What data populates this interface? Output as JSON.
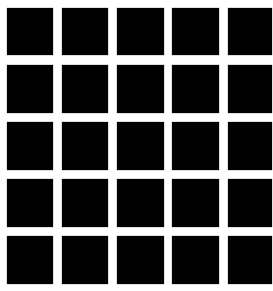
{
  "figure": {
    "type": "hermann-grid",
    "rows": 5,
    "cols": 5,
    "background_color": "#ffffff",
    "square_color": "#000000",
    "col_lefts": [
      7,
      62,
      117,
      172,
      228
    ],
    "col_widths": [
      46,
      46,
      47,
      47,
      44
    ],
    "row_tops": [
      8,
      65,
      122,
      179,
      236
    ],
    "row_heights": [
      47,
      48,
      48,
      48,
      48
    ]
  }
}
